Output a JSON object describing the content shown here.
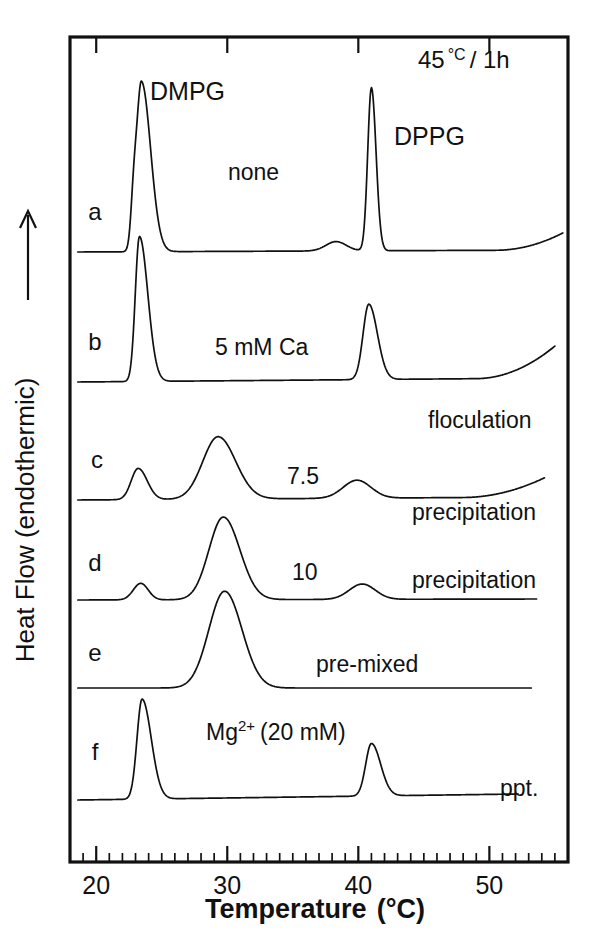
{
  "figure": {
    "type": "dsc-thermogram",
    "header_note": "45 °C / 1h",
    "header_note_value": "45",
    "header_note_unit": "°C",
    "header_note_time": "/ 1h"
  },
  "axes": {
    "x": {
      "label_main": "Temperature",
      "label_unit": "(°C)",
      "min": 18,
      "max": 56,
      "major_ticks": [
        20,
        30,
        40,
        50
      ],
      "major_tick_labels": [
        "20",
        "30",
        "40",
        "50"
      ],
      "minor_tick_step": 1
    },
    "y": {
      "label": "Heat Flow (endothermic)",
      "arrow": "up-arrow",
      "ticks": []
    }
  },
  "species_labels": [
    {
      "name": "DMPG",
      "text": "DMPG"
    },
    {
      "name": "DPPG",
      "text": "DPPG"
    }
  ],
  "chart_data": {
    "type": "line",
    "title": "",
    "subtitle": "45 °C / 1h",
    "xlabel": "Temperature (°C)",
    "ylabel": "Heat Flow (endothermic)",
    "xlim": [
      18,
      56
    ],
    "grid": false,
    "legend": "inline-annotations",
    "series": [
      {
        "id": "a",
        "label": "a",
        "condition": "none",
        "outcome": "",
        "peaks": [
          {
            "temperature": 23.4,
            "kind": "main",
            "assignment": "DMPG",
            "relative_height": 1.0
          },
          {
            "temperature": 22.8,
            "kind": "pre-transition",
            "assignment": "DMPG",
            "relative_height": 0.22
          },
          {
            "temperature": 41.0,
            "kind": "main",
            "assignment": "DPPG",
            "relative_height": 0.95
          },
          {
            "temperature": 38.2,
            "kind": "pre-transition",
            "assignment": "DPPG",
            "relative_height": 0.06
          }
        ]
      },
      {
        "id": "b",
        "label": "b",
        "condition": "5 mM Ca",
        "outcome": "floculation",
        "peaks": [
          {
            "temperature": 23.3,
            "kind": "main",
            "assignment": "DMPG",
            "relative_height": 1.0
          },
          {
            "temperature": 40.7,
            "kind": "main",
            "assignment": "DPPG",
            "relative_height": 0.52
          }
        ]
      },
      {
        "id": "c",
        "label": "c",
        "condition": "7.5",
        "outcome": "precipitation",
        "peaks": [
          {
            "temperature": 23.2,
            "kind": "shoulder",
            "assignment": "",
            "relative_height": 0.22
          },
          {
            "temperature": 29.3,
            "kind": "broad",
            "assignment": "",
            "relative_height": 0.46
          },
          {
            "temperature": 39.8,
            "kind": "broad",
            "assignment": "",
            "relative_height": 0.12
          }
        ]
      },
      {
        "id": "d",
        "label": "d",
        "condition": "10",
        "outcome": "precipitation",
        "peaks": [
          {
            "temperature": 23.3,
            "kind": "shoulder",
            "assignment": "",
            "relative_height": 0.12
          },
          {
            "temperature": 29.7,
            "kind": "broad",
            "assignment": "",
            "relative_height": 0.63
          },
          {
            "temperature": 40.2,
            "kind": "broad",
            "assignment": "",
            "relative_height": 0.1
          }
        ]
      },
      {
        "id": "e",
        "label": "e",
        "condition": "pre-mixed",
        "outcome": "",
        "peaks": [
          {
            "temperature": 29.8,
            "kind": "broad",
            "assignment": "",
            "relative_height": 0.72
          }
        ]
      },
      {
        "id": "f",
        "label": "f",
        "condition": "Mg2+ (20 mM)",
        "outcome": "ppt.",
        "peaks": [
          {
            "temperature": 23.5,
            "kind": "main",
            "assignment": "DMPG",
            "relative_height": 0.78
          },
          {
            "temperature": 41.0,
            "kind": "main",
            "assignment": "DPPG",
            "relative_height": 0.4
          }
        ]
      }
    ]
  },
  "curve_labels": [
    {
      "name": "curve-label-a",
      "text": "a"
    },
    {
      "name": "curve-label-b",
      "text": "b"
    },
    {
      "name": "curve-label-c",
      "text": "c"
    },
    {
      "name": "curve-label-d",
      "text": "d"
    },
    {
      "name": "curve-label-e",
      "text": "e"
    },
    {
      "name": "curve-label-f",
      "text": "f"
    }
  ],
  "annotations": {
    "none": "none",
    "ca_5mm": "5 mM  Ca",
    "floculation": "floculation",
    "conc_75": "7.5",
    "precipitation_c": "precipitation",
    "conc_10": "10",
    "precipitation_d": "precipitation",
    "premixed": "pre-mixed",
    "mg_label_base": "Mg",
    "mg_label_sup": "2+",
    "mg_label_conc": "(20 mM)",
    "ppt": "ppt."
  },
  "colors": {
    "ink": "#111111",
    "background": "#ffffff"
  }
}
